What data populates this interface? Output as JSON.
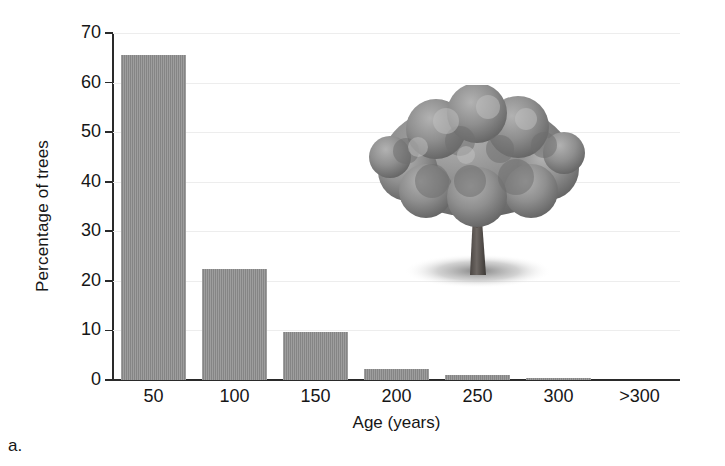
{
  "panel": {
    "label": "a."
  },
  "chart_data": {
    "type": "bar",
    "title": "",
    "subtitle": "",
    "xlabel": "Age (years)",
    "ylabel": "Percentage of trees",
    "categories": [
      "50",
      "100",
      "150",
      "200",
      "250",
      "300",
      ">300"
    ],
    "values": [
      65.5,
      22.3,
      9.7,
      2.3,
      1.1,
      0.5,
      0
    ],
    "series": [
      {
        "name": "Percentage of trees",
        "values": [
          65.5,
          22.3,
          9.7,
          2.3,
          1.1,
          0.5,
          0
        ]
      }
    ],
    "ylim": [
      0,
      70
    ],
    "ytick_labels": [
      "0",
      "10",
      "20",
      "30",
      "40",
      "50",
      "60",
      "70"
    ],
    "ytick_values": [
      0,
      10,
      20,
      30,
      40,
      50,
      60,
      70
    ],
    "xtick_labels": [
      "50",
      "100",
      "150",
      "200",
      "250",
      "300",
      ">300"
    ],
    "grid": "horizontal",
    "legend": "none",
    "bar_color": "#8c8c8c",
    "gridline_color": "#ededed",
    "axis_color": "#2a2a2a",
    "background_color": "#ffffff"
  },
  "annotations": {
    "tree_image_alt": "grayscale illustration of a broad deciduous oak tree with shadow"
  }
}
